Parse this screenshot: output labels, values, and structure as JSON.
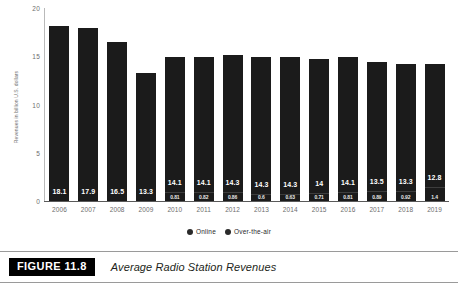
{
  "chart_data": {
    "type": "bar",
    "stacked": true,
    "title": "Average Radio Station Revenues",
    "xlabel": "",
    "ylabel": "Revenues in billion U.S. dollars",
    "ylim": [
      0,
      20
    ],
    "yticks": [
      "0",
      "5",
      "10",
      "15",
      "20"
    ],
    "grid": false,
    "legend_position": "bottom",
    "categories": [
      "2006",
      "2007",
      "2008",
      "2009",
      "2010",
      "2011",
      "2012",
      "2013",
      "2014",
      "2015",
      "2016",
      "2017",
      "2018",
      "2019"
    ],
    "series": [
      {
        "name": "Over-the-air",
        "color": "#1b1b1b",
        "values": [
          18.1,
          17.9,
          16.5,
          13.3,
          14.1,
          14.1,
          14.3,
          14.3,
          14.3,
          14,
          14.1,
          13.5,
          13.3,
          12.8
        ],
        "labels": [
          "18.1",
          "17.9",
          "16.5",
          "13.3",
          "14.1",
          "14.1",
          "14.3",
          "14.3",
          "14.3",
          "14",
          "14.1",
          "13.5",
          "13.3",
          "12.8"
        ]
      },
      {
        "name": "Online",
        "color": "#1b1b1b",
        "values": [
          null,
          null,
          null,
          null,
          0.81,
          0.82,
          0.86,
          0.6,
          0.63,
          0.71,
          0.81,
          0.89,
          0.92,
          1.4
        ],
        "labels": [
          "",
          "",
          "",
          "",
          "0.81",
          "0.82",
          "0.86",
          "0.6",
          "0.63",
          "0.71",
          "0.81",
          "0.89",
          "0.92",
          "1.4"
        ]
      }
    ]
  },
  "legend": [
    {
      "label": "Online",
      "marker": "circle-marker"
    },
    {
      "label": "Over-the-air",
      "marker": "circle-marker"
    }
  ],
  "caption": {
    "badge": "FIGURE 11.8",
    "title": "Average Radio Station Revenues"
  }
}
